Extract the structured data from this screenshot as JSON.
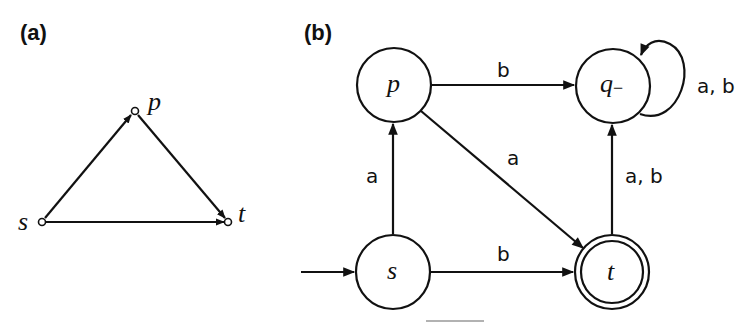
{
  "panel_a": {
    "label": "(a)",
    "nodes": [
      {
        "id": "s",
        "label": "s",
        "x": 42,
        "y": 222
      },
      {
        "id": "p",
        "label": "p",
        "x": 135,
        "y": 111
      },
      {
        "id": "t",
        "label": "t",
        "x": 228,
        "y": 222
      }
    ],
    "edges": [
      {
        "from": "s",
        "to": "p"
      },
      {
        "from": "p",
        "to": "t"
      },
      {
        "from": "s",
        "to": "t"
      }
    ]
  },
  "panel_b": {
    "label": "(b)",
    "states": [
      {
        "id": "p",
        "label": "p",
        "x": 394,
        "y": 85,
        "accepting": false,
        "initial": false
      },
      {
        "id": "q",
        "label": "q",
        "subscript": "−",
        "x": 613,
        "y": 86,
        "accepting": false,
        "initial": false
      },
      {
        "id": "s",
        "label": "s",
        "x": 393,
        "y": 272,
        "accepting": false,
        "initial": true
      },
      {
        "id": "t",
        "label": "t",
        "x": 612,
        "y": 272,
        "accepting": true,
        "initial": false
      }
    ],
    "transitions": [
      {
        "from": "p",
        "to": "q",
        "label": "b"
      },
      {
        "from": "p",
        "to": "t",
        "label": "a"
      },
      {
        "from": "s",
        "to": "p",
        "label": "a"
      },
      {
        "from": "s",
        "to": "t",
        "label": "b"
      },
      {
        "from": "t",
        "to": "q",
        "label": "a, b"
      },
      {
        "from": "q",
        "to": "q",
        "label": "a, b"
      }
    ]
  }
}
